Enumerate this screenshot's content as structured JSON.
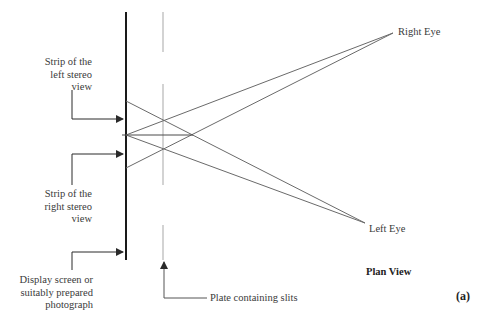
{
  "diagram": {
    "title": "Plan View",
    "panel_label": "(a)",
    "labels": {
      "right_eye": "Right Eye",
      "left_eye": "Left Eye",
      "left_strip": [
        "Strip of the",
        "left stereo",
        "view"
      ],
      "right_strip": [
        "Strip of the",
        "right stereo",
        "view"
      ],
      "display": [
        "Display screen or",
        "suitably prepared",
        "photograph"
      ],
      "plate": "Plate containing slits"
    },
    "colors": {
      "screen": "#1a1a1a",
      "plate": "#c8c8c8",
      "rays": "#6a6a6a",
      "arrows": "#2a2a2a",
      "text": "#3a3a3a"
    },
    "points": {
      "right_eye": [
        393,
        33
      ],
      "left_eye": [
        365,
        223
      ],
      "screen_x": 126,
      "plate_x": 163
    }
  }
}
